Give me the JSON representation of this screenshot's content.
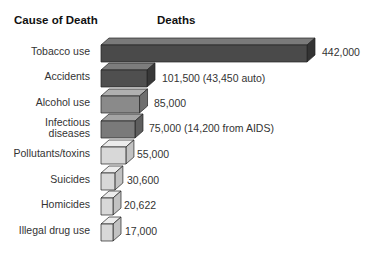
{
  "headers": {
    "cause": "Cause of Death",
    "deaths": "Deaths"
  },
  "rows": [
    {
      "label": "Tobacco use",
      "value_label": "442,000",
      "front": "#4a4a4a",
      "top": "#7a7a7a",
      "side": "#333333"
    },
    {
      "label": "Accidents",
      "value_label": "101,500 (43,450 auto)",
      "front": "#4f4f4f",
      "top": "#7d7d7d",
      "side": "#383838"
    },
    {
      "label": "Alcohol use",
      "value_label": "85,000",
      "front": "#8a8a8a",
      "top": "#b0b0b0",
      "side": "#6e6e6e"
    },
    {
      "label": "Infectious diseases",
      "value_label": "75,000 (14,200 from AIDS)",
      "front": "#7a7a7a",
      "top": "#a4a4a4",
      "side": "#5e5e5e"
    },
    {
      "label": "Pollutants/toxins",
      "value_label": "55,000",
      "front": "#d8d8d8",
      "top": "#ececec",
      "side": "#c2c2c2"
    },
    {
      "label": "Suicides",
      "value_label": "30,600",
      "front": "#d8d8d8",
      "top": "#ececec",
      "side": "#c2c2c2"
    },
    {
      "label": "Homicides",
      "value_label": "20,622",
      "front": "#d8d8d8",
      "top": "#ececec",
      "side": "#c2c2c2"
    },
    {
      "label": "Illegal drug use",
      "value_label": "17,000",
      "front": "#d8d8d8",
      "top": "#ececec",
      "side": "#c2c2c2"
    }
  ],
  "chart_data": {
    "type": "bar",
    "orientation": "horizontal",
    "title": "",
    "xlabel": "Deaths",
    "ylabel": "Cause of Death",
    "categories": [
      "Tobacco use",
      "Accidents",
      "Alcohol use",
      "Infectious diseases",
      "Pollutants/toxins",
      "Suicides",
      "Homicides",
      "Illegal drug use"
    ],
    "values": [
      442000,
      101500,
      85000,
      75000,
      55000,
      30600,
      20622,
      17000
    ],
    "annotations": [
      "442,000",
      "101,500 (43,450 auto)",
      "85,000",
      "75,000 (14,200 from AIDS)",
      "55,000",
      "30,600",
      "20,622",
      "17,000"
    ],
    "grid": false,
    "legend": null,
    "style": "3d-bar"
  }
}
